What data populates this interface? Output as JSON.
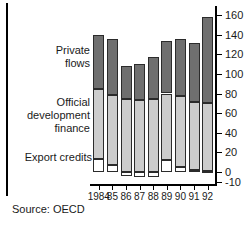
{
  "chart_data": {
    "type": "bar",
    "stacked": true,
    "title": "",
    "subtitle": "",
    "xlabel": "",
    "ylabel": "",
    "source": "Source: OECD",
    "grid": false,
    "legend_position": "left",
    "categories": [
      "1984",
      "85",
      "86",
      "87",
      "88",
      "89",
      "90",
      "91",
      "92"
    ],
    "ylim": [
      -10,
      160
    ],
    "yticks": [
      -10,
      0,
      20,
      40,
      60,
      80,
      100,
      120,
      140,
      160
    ],
    "ytick_labels": [
      "-10",
      "0",
      "20",
      "40",
      "60",
      "80",
      "100",
      "120",
      "140",
      "160"
    ],
    "series": [
      {
        "name": "Export credits",
        "color": "#ffffff",
        "values": [
          13,
          7,
          -4,
          -5,
          -5,
          12,
          5,
          2,
          1
        ]
      },
      {
        "name": "Official development finance",
        "color": "#cccccc",
        "values": [
          72,
          71,
          74,
          73,
          74,
          68,
          72,
          69,
          69
        ]
      },
      {
        "name": "Private flows",
        "color": "#6f6f6f",
        "values": [
          55,
          58,
          34,
          37,
          43,
          53,
          59,
          60,
          88
        ]
      }
    ],
    "totals": [
      140,
      136,
      104,
      105,
      112,
      133,
      136,
      131,
      158
    ],
    "legend": [
      {
        "id": "private-flows",
        "label": "Private\nflows"
      },
      {
        "id": "official-development-finance",
        "label": "Official\ndevelopment\nfinance"
      },
      {
        "id": "export-credits",
        "label": "Export credits"
      }
    ]
  }
}
